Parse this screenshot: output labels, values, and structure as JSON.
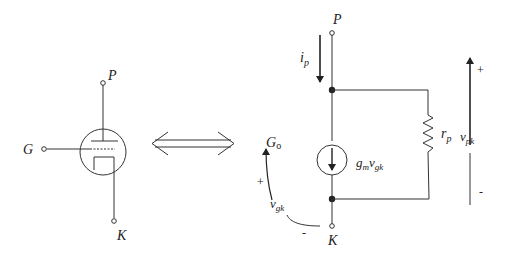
{
  "diagram": {
    "triode": {
      "plate_label": "P",
      "grid_label": "G",
      "cathode_label": "K"
    },
    "equivalence_symbol": "⟺",
    "equivalent_circuit": {
      "plate_label": "P",
      "cathode_label": "K",
      "grid_label": "G",
      "grid_label_sub": "o",
      "current_label": "i",
      "current_label_sub": "p",
      "source_label_g": "g",
      "source_label_g_sub": "m",
      "source_label_v": "v",
      "source_label_v_sub": "gk",
      "resistor_label": "r",
      "resistor_label_sub": "p",
      "vgk_label": "v",
      "vgk_label_sub": "gk",
      "vgk_plus": "+",
      "vgk_minus": "-",
      "vpk_label": "v",
      "vpk_label_sub": "pk",
      "vpk_plus": "+",
      "vpk_minus": "-"
    }
  }
}
